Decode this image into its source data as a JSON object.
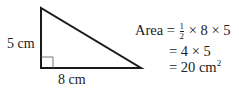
{
  "diagram": {
    "shape": "right-triangle",
    "vertices": {
      "top": [
        41,
        8
      ],
      "right_angle": [
        41,
        68
      ],
      "right": [
        141,
        68
      ]
    },
    "labels": {
      "height": "5 cm",
      "base": "8 cm"
    },
    "right_angle_marker": true
  },
  "equation": {
    "line1": {
      "lhs": "Area",
      "eq": "=",
      "frac_num": "1",
      "frac_den": "2",
      "rest": "× 8 × 5"
    },
    "line2": "= 4 × 5",
    "line3": {
      "text": "= 20 cm",
      "exponent": "2"
    }
  },
  "colors": {
    "stroke": "#1a1a1a",
    "text": "#222222"
  }
}
